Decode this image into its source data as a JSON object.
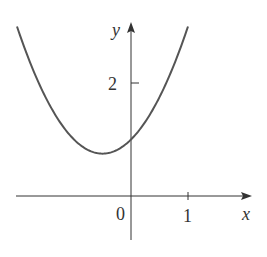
{
  "chart_data": {
    "type": "line",
    "title": "",
    "function": "y = x^2 + x + 1",
    "xlabel": "x",
    "ylabel": "y",
    "xlim": [
      -2.0,
      2.1
    ],
    "ylim": [
      -0.8,
      3.05
    ],
    "x_ticks": [
      {
        "value": 1,
        "label": "1"
      }
    ],
    "y_ticks": [
      {
        "value": 2,
        "label": "2"
      }
    ],
    "origin_label": "0",
    "series": [
      {
        "name": "curve",
        "x": [
          -2.0,
          -1.5,
          -1.0,
          -0.5,
          0.0,
          0.5,
          1.0
        ],
        "y": [
          3.0,
          1.75,
          1.0,
          0.75,
          1.0,
          1.75,
          3.0
        ]
      }
    ],
    "grid": false,
    "legend": null
  },
  "colors": {
    "curve": "#555555",
    "axes": "#333333",
    "background": "#ffffff"
  }
}
